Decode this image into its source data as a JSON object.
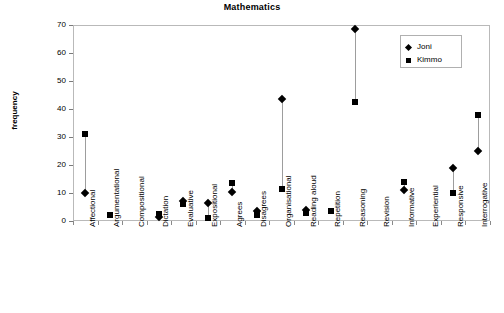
{
  "chart_data": {
    "type": "scatter",
    "title": "Mathematics",
    "xlabel": "",
    "ylabel": "frequency",
    "ylim": [
      0,
      70
    ],
    "yticks": [
      0,
      10,
      20,
      30,
      40,
      50,
      60,
      70
    ],
    "grid": false,
    "legend_position": "top-right",
    "categories": [
      "Affectional",
      "Argumentational",
      "Compositional",
      "Dictation",
      "Evaluative",
      "Expositional",
      "Agrees",
      "Disagrees",
      "Organisational",
      "Reading aloud",
      "Repetition",
      "Reasoning",
      "Revision",
      "Informative",
      "Experiential",
      "Responsive",
      "Interrogative"
    ],
    "series": [
      {
        "name": "Joni",
        "marker": "diamond",
        "color": "#000000",
        "values": [
          10,
          null,
          null,
          1.5,
          7,
          6.5,
          10.5,
          3.5,
          43.5,
          4,
          null,
          68.5,
          null,
          11,
          null,
          19,
          25
        ]
      },
      {
        "name": "Kimmo",
        "marker": "square",
        "color": "#000000",
        "values": [
          31,
          2,
          null,
          2.5,
          6,
          1,
          13.5,
          2,
          11.5,
          3,
          3.5,
          42.5,
          null,
          14,
          null,
          10,
          38
        ]
      }
    ]
  },
  "legend": {
    "entries": [
      {
        "label": "Joni",
        "marker": "diamond"
      },
      {
        "label": "Kimmo",
        "marker": "square"
      }
    ]
  }
}
